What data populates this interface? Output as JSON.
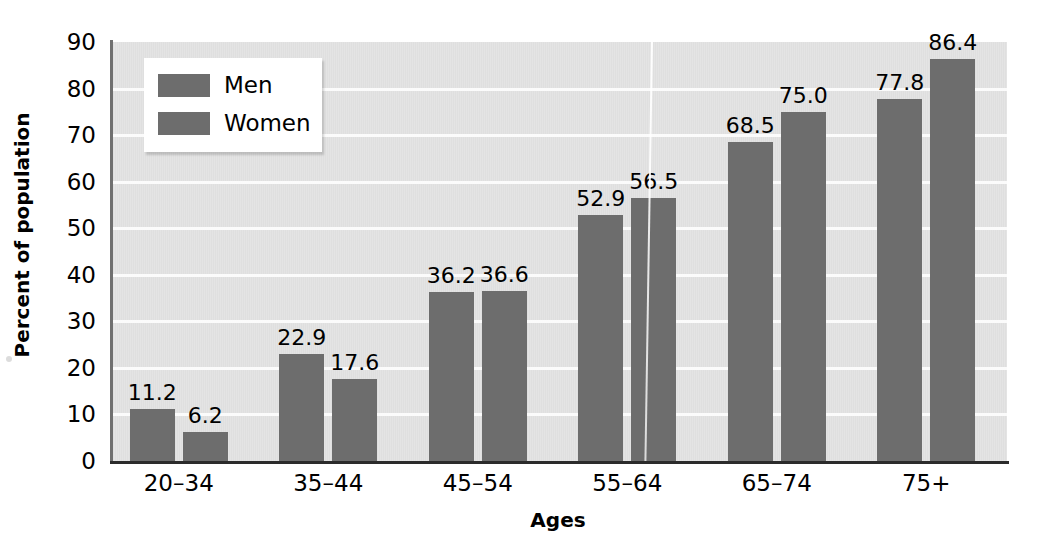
{
  "chart_data": {
    "type": "bar",
    "title": "",
    "subtitle": "",
    "xlabel": "Ages",
    "ylabel": "Percent of population",
    "categories": [
      "20–34",
      "35–44",
      "45–54",
      "55–64",
      "65–74",
      "75+"
    ],
    "series": [
      {
        "name": "Men",
        "values": [
          11.2,
          22.9,
          36.2,
          52.9,
          68.5,
          77.8
        ],
        "color": "#6d6d6d"
      },
      {
        "name": "Women",
        "values": [
          6.2,
          17.6,
          36.6,
          56.5,
          75.0,
          86.4
        ],
        "color": "#6d6d6d"
      }
    ],
    "value_labels": [
      [
        "11.2",
        "22.9",
        "36.2",
        "52.9",
        "68.5",
        "77.8"
      ],
      [
        "6.2",
        "17.6",
        "36.6",
        "56.5",
        "75.0",
        "86.4"
      ]
    ],
    "ylim": [
      0,
      90
    ],
    "yticks": [
      0,
      10,
      20,
      30,
      40,
      50,
      60,
      70,
      80,
      90
    ],
    "ytick_labels": [
      "0",
      "10",
      "20",
      "30",
      "40",
      "50",
      "60",
      "70",
      "80",
      "90"
    ],
    "grid": true,
    "grid_axis": "y",
    "grid_color": "#fbfbfb",
    "plot_background": "#e3e3e3",
    "legend_position": "upper left",
    "legend_entries": [
      "Men",
      "Women"
    ]
  },
  "legend": {
    "entries": [
      {
        "label": "Men",
        "color": "#6d6d6d"
      },
      {
        "label": "Women",
        "color": "#6d6d6d"
      }
    ]
  },
  "axes": {
    "y_title": "Percent of population",
    "x_title": "Ages"
  }
}
